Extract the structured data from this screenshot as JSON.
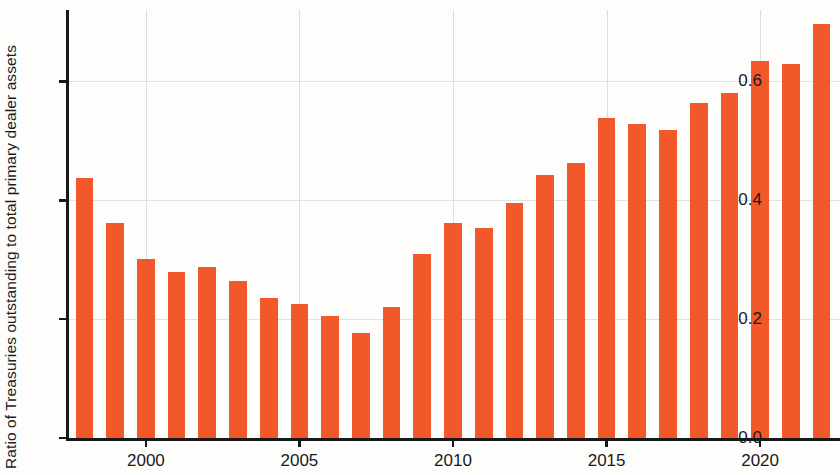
{
  "chart_data": {
    "type": "bar",
    "title": "",
    "subtitle": "",
    "xlabel": "",
    "ylabel": "Ratio of Treasuries outstanding to total primary dealer assets",
    "ylim": [
      0.0,
      0.72
    ],
    "xlim": [
      1997.4,
      2022.6
    ],
    "grid": true,
    "legend": null,
    "bar_color": "#f2582a",
    "axis_color": "#16181a",
    "grid_color": "#e2e1e0",
    "ytick_labels": [
      "0.0",
      "0.2",
      "0.4",
      "0.6"
    ],
    "ytick_values": [
      0.0,
      0.2,
      0.4,
      0.6
    ],
    "xtick_labels": [
      "2000",
      "2005",
      "2010",
      "2015",
      "2020"
    ],
    "xtick_values": [
      2000,
      2005,
      2010,
      2015,
      2020
    ],
    "categories": [
      1998,
      1999,
      2000,
      2001,
      2002,
      2003,
      2004,
      2005,
      2006,
      2007,
      2008,
      2009,
      2010,
      2011,
      2012,
      2013,
      2014,
      2015,
      2016,
      2017,
      2018,
      2019,
      2020,
      2021,
      2022
    ],
    "values": [
      0.437,
      0.362,
      0.302,
      0.279,
      0.287,
      0.264,
      0.236,
      0.226,
      0.205,
      0.177,
      0.221,
      0.31,
      0.361,
      0.353,
      0.396,
      0.442,
      0.463,
      0.539,
      0.529,
      0.519,
      0.564,
      0.581,
      0.635,
      0.629,
      0.697
    ]
  }
}
